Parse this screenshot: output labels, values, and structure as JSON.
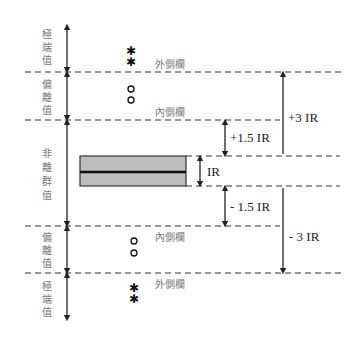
{
  "diagram": {
    "type": "boxplot-fences-explanation",
    "left_labels": {
      "extreme_top": [
        "極",
        "端",
        "值"
      ],
      "outlier_top": [
        "偏",
        "離",
        "值"
      ],
      "non_outlier": [
        "非",
        "離",
        "群",
        "值"
      ],
      "outlier_bottom": [
        "偏",
        "離",
        "值"
      ],
      "extreme_bottom": [
        "極",
        "端",
        "值"
      ]
    },
    "fence_labels": {
      "outer_top": "外側欄",
      "inner_top": "內側欄",
      "inner_bottom": "內側欄",
      "outer_bottom": "外側欄"
    },
    "markers": {
      "extreme_symbol": "✱",
      "outlier_symbol": "o"
    },
    "distance_labels": {
      "plus_1_5": "+1.5 IR",
      "ir": "IR",
      "minus_1_5": "- 1.5 IR",
      "plus_3": "+3 IR",
      "minus_3": "- 3 IR"
    },
    "colors": {
      "box_fill": "#bdbdbd",
      "line": "#222222",
      "label_gray": "#777777"
    }
  }
}
